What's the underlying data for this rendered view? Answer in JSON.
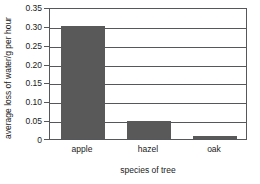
{
  "chart_data": {
    "type": "bar",
    "title": "",
    "subtitle": "",
    "categories": [
      "apple",
      "hazel",
      "oak"
    ],
    "values": [
      0.3,
      0.048,
      0.007
    ],
    "xlabel": "species of tree",
    "ylabel": "average loss of water/g per hour",
    "ylim": [
      0,
      0.35
    ],
    "yticks": [
      0,
      0.05,
      0.1,
      0.15,
      0.2,
      0.25,
      0.3,
      0.35
    ],
    "ytick_labels": [
      "0",
      "0.05",
      "0.10",
      "0.15",
      "0.20",
      "0.25",
      "0.30",
      "0.35"
    ],
    "grid": true,
    "grid_axis": "y",
    "legend": false,
    "legend_position": "none",
    "bar_color": "#595959",
    "axis_color": "#55575a",
    "background_color": "#ffffff",
    "frame": true
  }
}
